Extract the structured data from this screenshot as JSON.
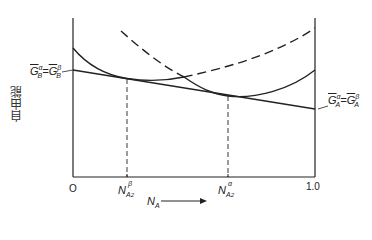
{
  "diagram": {
    "y_axis_label": "自由能",
    "x_axis_label": {
      "base": "N",
      "sub": "A"
    },
    "x_ticks": [
      {
        "id": "origin",
        "text": "O"
      },
      {
        "id": "end",
        "text": "1.0"
      }
    ],
    "markers": [
      {
        "id": "beta_comp",
        "base": "N",
        "sub": "A",
        "subsub": "2",
        "sup": "β"
      },
      {
        "id": "alpha_comp",
        "base": "N",
        "sub": "A",
        "subsub": "2",
        "sup": "α"
      }
    ],
    "left_intercept_label": {
      "left": {
        "base": "G",
        "sub": "B",
        "sup": "α"
      },
      "eq": "=",
      "right": {
        "base": "G",
        "sub": "B",
        "sup": "β"
      }
    },
    "right_intercept_label": {
      "left": {
        "base": "G",
        "sub": "A",
        "sup": "α"
      },
      "eq": "=",
      "right": {
        "base": "G",
        "sub": "A",
        "sup": "β"
      }
    },
    "curves": [
      {
        "id": "alpha-phase-curve",
        "style": "solid-then-dashed"
      },
      {
        "id": "beta-phase-curve",
        "style": "dashed-then-solid"
      },
      {
        "id": "common-tangent",
        "style": "solid"
      }
    ],
    "colors": {
      "line": "#222222",
      "background": "#ffffff"
    }
  }
}
